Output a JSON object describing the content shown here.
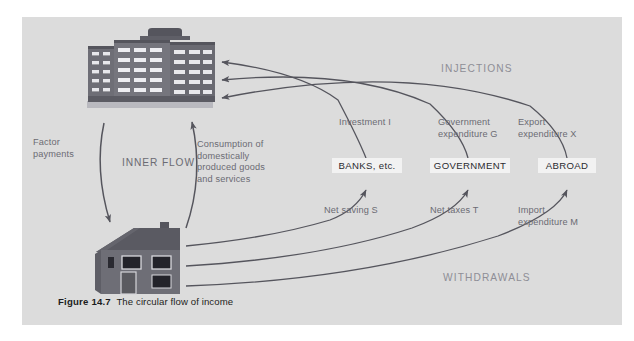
{
  "figure": {
    "caption_number": "Figure 14.7",
    "caption_text": "The circular flow of income",
    "panel_color": "#dcdcdc",
    "page_color": "#ffffff"
  },
  "icons": {
    "firms": {
      "name": "office-building-icon",
      "alt": "Firms - office building",
      "body_color": "#6e6e76",
      "window_color": "#e8e8ec",
      "shadow_color": "#b9b9bf"
    },
    "households": {
      "name": "house-icon",
      "alt": "Households - house",
      "body_color": "#6e6e76",
      "roof_color": "#55555d",
      "window_color": "#23232a"
    }
  },
  "bands": {
    "injections": "INJECTIONS",
    "withdrawals": "WITHDRAWALS",
    "band_color": "#8e8e96"
  },
  "inner_flow": {
    "title": "INNER FLOW",
    "left_label": "Factor\npayments",
    "right_label": "Consumption of\ndomestically\nproduced goods\nand services",
    "label_color": "#6b6b73"
  },
  "sectors": [
    {
      "id": "banks",
      "label": "BANKS, etc."
    },
    {
      "id": "government",
      "label": "GOVERNMENT"
    },
    {
      "id": "abroad",
      "label": "ABROAD"
    }
  ],
  "injection_labels": [
    {
      "id": "investment",
      "label": "Investment I"
    },
    {
      "id": "government-expenditure",
      "label": "Government\nexpenditure G"
    },
    {
      "id": "export-expenditure",
      "label": "Export\nexpenditure X"
    }
  ],
  "withdrawal_labels": [
    {
      "id": "net-saving",
      "label": "Net saving S"
    },
    {
      "id": "net-taxes",
      "label": "Net taxes T"
    },
    {
      "id": "import-expenditure",
      "label": "Import\nexpenditure M"
    }
  ],
  "arrows": {
    "stroke_color": "#55555d",
    "injection_count": 3,
    "withdrawal_count": 3,
    "inner_flow_directions": [
      "firms-to-households",
      "households-to-firms"
    ]
  }
}
